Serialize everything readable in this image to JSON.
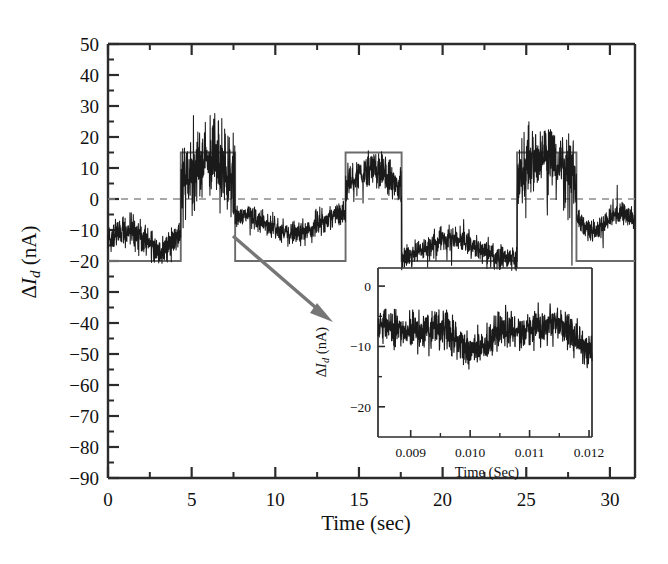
{
  "figure": {
    "background": "#ffffff",
    "trace_color": "#1a1a1a",
    "gate_color": "#6b6b6b",
    "zeroline_color": "#8c8c8c",
    "arrow_color": "#767676",
    "axis_color": "#2b2b2b"
  },
  "main": {
    "ylabel_delta": "Δ",
    "ylabel_var": "I",
    "ylabel_sub": "d",
    "ylabel_units": " (nA)",
    "ylabel_full": "ΔI_d (nA)",
    "xlabel": "Time (sec)",
    "ytick_labels": [
      "50",
      "40",
      "30",
      "20",
      "10",
      "0",
      "−10",
      "−20",
      "−30",
      "−40",
      "−50",
      "−60",
      "−70",
      "−80",
      "−90"
    ],
    "xtick_labels": [
      "0",
      "5",
      "10",
      "15",
      "20",
      "25",
      "30"
    ]
  },
  "inset": {
    "ylabel_delta": "Δ",
    "ylabel_var": "I",
    "ylabel_sub": "d",
    "ylabel_units": " (nA)",
    "ylabel_full": "ΔI_d (nA)",
    "xlabel": "Time (Sec)",
    "ytick_labels": [
      "0",
      "−10",
      "−20"
    ],
    "xtick_labels": [
      "0.009",
      "0.010",
      "0.011",
      "0.012"
    ]
  },
  "chart_data": {
    "type": "line",
    "title": "",
    "xlabel": "Time (sec)",
    "ylabel": "ΔI_d (nA)",
    "xlim": [
      0,
      31.5
    ],
    "ylim": [
      -90,
      50
    ],
    "ytick_values": [
      50,
      40,
      30,
      20,
      10,
      0,
      -10,
      -20,
      -30,
      -40,
      -50,
      -60,
      -70,
      -80,
      -90
    ],
    "xtick_values": [
      0,
      5,
      10,
      15,
      20,
      25,
      30
    ],
    "minor_ticks": true,
    "grid": false,
    "legend": "none",
    "annotations": [
      {
        "kind": "zero-line",
        "y": 0,
        "style": "dashed",
        "color": "#8c8c8c"
      },
      {
        "kind": "arrow",
        "from": [
          7.2,
          -35
        ],
        "to": [
          12.0,
          -63
        ],
        "color": "#767676",
        "meaning": "callout from main trace low region to inset panel"
      }
    ],
    "series": [
      {
        "name": "drain current noise trace",
        "color": "#1a1a1a",
        "description": "High-bandwidth noisy drain-current signal modulated by gate square wave; low plateaus near -13 nA, high plateaus near +10 nA",
        "plateau_low_mean": -13,
        "plateau_high_mean": 10,
        "noise_amplitude_low": 5,
        "noise_amplitude_high": 12,
        "segments": [
          {
            "t_start": 0.0,
            "t_end": 4.35,
            "level": -13,
            "noise": 5
          },
          {
            "t_start": 4.35,
            "t_end": 7.6,
            "level": 10,
            "noise": 12
          },
          {
            "t_start": 7.6,
            "t_end": 14.2,
            "level": -8,
            "noise": 4
          },
          {
            "t_start": 14.2,
            "t_end": 17.55,
            "level": 8,
            "noise": 6
          },
          {
            "t_start": 17.55,
            "t_end": 24.45,
            "level": -16,
            "noise": 4
          },
          {
            "t_start": 24.45,
            "t_end": 28.0,
            "level": 11,
            "noise": 11
          },
          {
            "t_start": 28.0,
            "t_end": 31.5,
            "level": -7,
            "noise": 4
          }
        ]
      },
      {
        "name": "gate square wave",
        "color": "#6b6b6b",
        "description": "Reference square-wave modulation overlay",
        "low_level": -20,
        "high_level": 15,
        "transitions": [
          4.35,
          7.6,
          14.2,
          17.55,
          24.45,
          28.0
        ],
        "points": [
          [
            0.0,
            -20
          ],
          [
            4.35,
            -20
          ],
          [
            4.35,
            15
          ],
          [
            7.6,
            15
          ],
          [
            7.6,
            -20
          ],
          [
            14.2,
            -20
          ],
          [
            14.2,
            15
          ],
          [
            17.55,
            15
          ],
          [
            17.55,
            -20
          ],
          [
            24.45,
            -20
          ],
          [
            24.45,
            15
          ],
          [
            28.0,
            15
          ],
          [
            28.0,
            -20
          ],
          [
            31.5,
            -20
          ]
        ]
      }
    ]
  },
  "inset_chart_data": {
    "type": "line",
    "title": "",
    "xlabel": "Time (Sec)",
    "ylabel": "ΔI_d (nA)",
    "xlim": [
      0.00845,
      0.01205
    ],
    "ylim": [
      -25,
      3
    ],
    "xtick_values": [
      0.009,
      0.01,
      0.011,
      0.012
    ],
    "ytick_values": [
      0,
      -10,
      -20
    ],
    "grid": false,
    "legend": "none",
    "series": [
      {
        "name": "zoomed drain current noise",
        "color": "#1a1a1a",
        "description": "Expanded-time view of the noisy drain current, mean near -8 nA with ~4 nA peak-to-peak fluctuation",
        "mean": -8,
        "noise_amplitude": 4
      }
    ]
  }
}
